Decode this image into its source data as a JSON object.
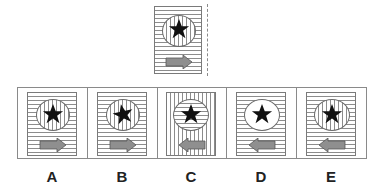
{
  "puzzle": {
    "type": "mirror-image visual reasoning",
    "mirror_line": "vertical dashed line to the right of the question figure",
    "question_figure": {
      "background": "horizontal-lines",
      "circle_fill": "vertical-lines",
      "star": "upright",
      "arrow_direction": "right"
    },
    "options": [
      {
        "label": "A",
        "background": "horizontal-lines",
        "circle_fill": "vertical-lines",
        "star": "upright",
        "arrow_direction": "right"
      },
      {
        "label": "B",
        "background": "horizontal-lines",
        "circle_fill": "vertical-lines",
        "star": "tilted",
        "arrow_direction": "right"
      },
      {
        "label": "C",
        "background": "vertical-lines",
        "circle_fill": "horizontal-lines",
        "star": "upright",
        "arrow_direction": "left"
      },
      {
        "label": "D",
        "background": "horizontal-lines",
        "circle_fill": "plain",
        "star": "upright",
        "arrow_direction": "left"
      },
      {
        "label": "E",
        "background": "horizontal-lines",
        "circle_fill": "vertical-lines",
        "star": "upright",
        "arrow_direction": "left"
      }
    ]
  },
  "colors": {
    "line": "#8c8c8c",
    "border": "#7a7a7a",
    "star": "#111111",
    "arrow_fill": "#8f8f8f",
    "arrow_stroke": "#555555",
    "label": "#222222"
  },
  "icons": {
    "star": "star-icon",
    "arrow_right": "arrow-right-icon",
    "arrow_left": "arrow-left-icon"
  }
}
